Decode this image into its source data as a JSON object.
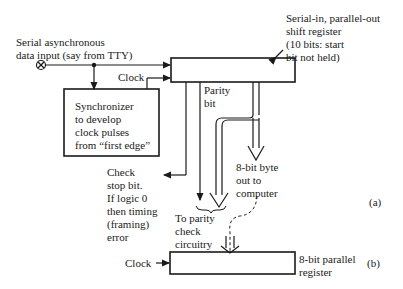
{
  "input": {
    "label_line1": "Serial asynchronous",
    "label_line2": "data input (say from TTY)"
  },
  "clock_top": "Clock",
  "shift_register": {
    "label_line1": "Serial-in, parallel-out",
    "label_line2": "shift register",
    "label_line3": "(10 bits: start",
    "label_line4": "bit not held)"
  },
  "synchronizer": {
    "line1": "Synchronizer",
    "line2": "to develop",
    "line3": "clock pulses",
    "line4": "from “first edge”"
  },
  "parity": {
    "line1": "Parity",
    "line2": "bit"
  },
  "stop_check": {
    "line1": "Check",
    "line2": "stop bit.",
    "line3": "If logic 0",
    "line4": "then timing",
    "line5": "(framing)",
    "line6": "error"
  },
  "byte_out": {
    "line1": "8-bit byte",
    "line2": "out to",
    "line3": "computer"
  },
  "parity_check": {
    "line1": "To parity",
    "line2": "check",
    "line3": "circuitry"
  },
  "clock_bottom": "Clock",
  "parallel_register": {
    "line1": "8-bit parallel",
    "line2": "register"
  },
  "part_a": "(a)",
  "part_b": "(b)"
}
